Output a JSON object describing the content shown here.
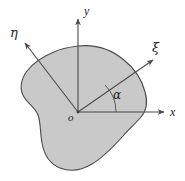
{
  "figure": {
    "background_color": "#ffffff",
    "body": {
      "name": "shaded-plane-body",
      "fill_color": "#c9c9c9",
      "stroke_color": "#4a4a4a",
      "stroke_width": 1.1
    },
    "origin": {
      "label": "o",
      "x": 78,
      "y": 112
    },
    "axes": [
      {
        "id": "y-axis",
        "label": "y",
        "direction": "up",
        "from": [
          78,
          112
        ],
        "to": [
          78,
          16
        ],
        "arrow": true,
        "color": "#4a4a4a"
      },
      {
        "id": "x-axis",
        "label": "x",
        "direction": "right",
        "from": [
          78,
          112
        ],
        "to": [
          167,
          112
        ],
        "arrow": true,
        "color": "#4a4a4a"
      },
      {
        "id": "xi-axis",
        "label": "ξ",
        "direction": "up-right",
        "from": [
          78,
          112
        ],
        "to": [
          156,
          57
        ],
        "arrow": true,
        "color": "#4a4a4a"
      },
      {
        "id": "eta-axis",
        "label": "η",
        "direction": "up-left",
        "from": [
          78,
          112
        ],
        "to": [
          23,
          40
        ],
        "arrow": true,
        "color": "#4a4a4a"
      }
    ],
    "angle": {
      "id": "alpha-angle",
      "label": "α",
      "between": [
        "x-axis",
        "xi-axis"
      ],
      "vertex": [
        78,
        112
      ],
      "radius": 38,
      "color": "#4a4a4a"
    }
  }
}
